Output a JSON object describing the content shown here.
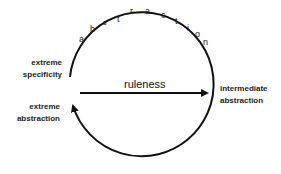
{
  "diagram": {
    "arc_label": "abstraction",
    "arc_letters": [
      "a",
      "b",
      "s",
      "t",
      "r",
      "a",
      "c",
      "t",
      "i",
      "o",
      "n"
    ],
    "center_arrow_label": "ruleness",
    "nodes": {
      "extreme_specificity": [
        "extreme",
        "specificity"
      ],
      "intermediate_abstraction": [
        "intermediate",
        "abstraction"
      ],
      "extreme_abstraction": [
        "extreme",
        "abstraction"
      ]
    },
    "colors": {
      "stroke": "#111111",
      "text": "#222222",
      "background": "#ffffff"
    }
  }
}
